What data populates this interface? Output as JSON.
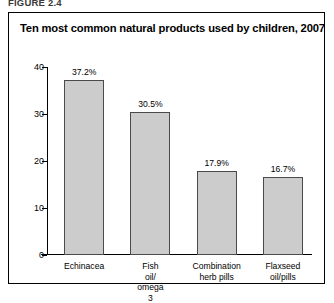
{
  "figure_caption": "FIGURE 2.4",
  "frame": {
    "border_color": "#000000",
    "background": "#ffffff"
  },
  "chart_data": {
    "type": "bar",
    "title": "Ten most common natural products used by children, 2007",
    "categories": [
      "Echinacea",
      "Fish oil/\nomega 3",
      "Combination\nherb pills",
      "Flaxseed\noil/pills"
    ],
    "values": [
      37.2,
      30.5,
      17.9,
      16.7
    ],
    "value_labels": [
      "37.2%",
      "30.5%",
      "17.9%",
      "16.7%"
    ],
    "xlabel": "",
    "ylabel": "",
    "ylim": [
      0,
      40
    ],
    "yticks": [
      0,
      10,
      20,
      30,
      40
    ],
    "ytick_labels": [
      "0",
      "10",
      "20",
      "30",
      "40"
    ],
    "grid": false,
    "legend": false,
    "bar_fill_color": "#cccccc",
    "bar_border_color": "#4a4a4a",
    "axis_color": "#000000"
  }
}
